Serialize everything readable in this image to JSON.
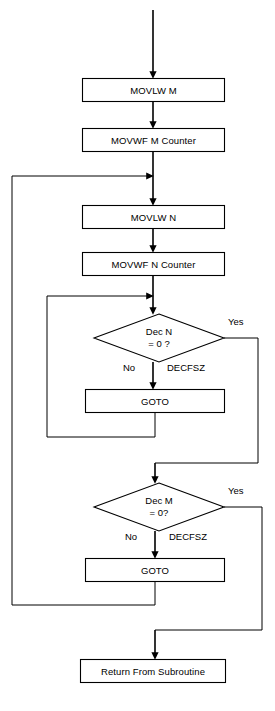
{
  "diagram": {
    "type": "flowchart",
    "stroke_color": "#000000",
    "fill_color": "#ffffff",
    "background_color": "#ffffff"
  },
  "nodes": {
    "movlw_m": {
      "label": "MOVLW M",
      "shape": "process"
    },
    "movwf_m": {
      "label": "MOVWF M Counter",
      "shape": "process"
    },
    "movlw_n": {
      "label": "MOVLW N",
      "shape": "process"
    },
    "movwf_n": {
      "label": "MOVWF N Counter",
      "shape": "process"
    },
    "dec_n": {
      "line1": "Dec N",
      "line2": "= 0 ?",
      "shape": "decision"
    },
    "goto_n": {
      "label": "GOTO",
      "shape": "process"
    },
    "dec_m": {
      "line1": "Dec M",
      "line2": "= 0?",
      "shape": "decision"
    },
    "goto_m": {
      "label": "GOTO",
      "shape": "process"
    },
    "return_sub": {
      "label": "Return From Subroutine",
      "shape": "process"
    }
  },
  "edge_labels": {
    "dec_n_yes": "Yes",
    "dec_n_no": "No",
    "dec_n_instr": "DECFSZ",
    "dec_m_yes": "Yes",
    "dec_m_no": "No",
    "dec_m_instr": "DECFSZ"
  }
}
